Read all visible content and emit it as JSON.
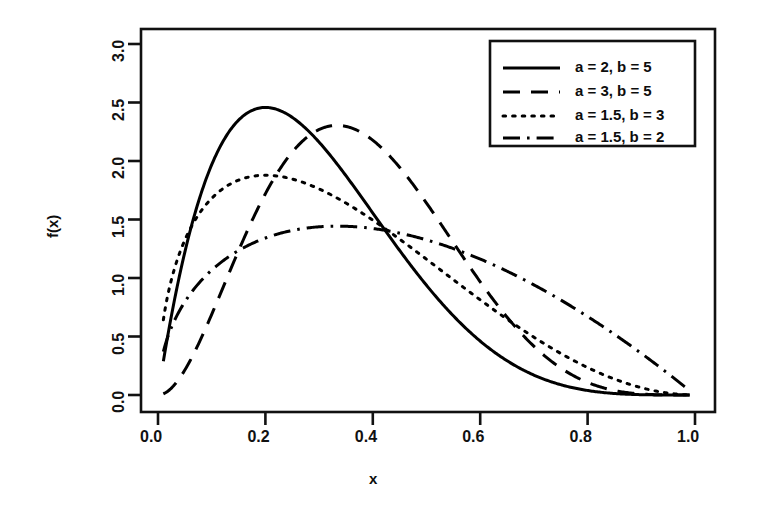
{
  "chart_data": {
    "type": "line",
    "title": "",
    "subtitle": "",
    "xlabel": "x",
    "ylabel": "f(x)",
    "xlim": [
      0.0,
      1.0
    ],
    "ylim": [
      0.0,
      3.0
    ],
    "xticks": [
      "0.0",
      "0.2",
      "0.4",
      "0.6",
      "0.8",
      "1.0"
    ],
    "xtick_values": [
      0.0,
      0.2,
      0.4,
      0.6,
      0.8,
      1.0
    ],
    "yticks": [
      "0.0",
      "0.5",
      "1.0",
      "1.5",
      "2.0",
      "2.5",
      "3.0"
    ],
    "ytick_values": [
      0.0,
      0.5,
      1.0,
      1.5,
      2.0,
      2.5,
      3.0
    ],
    "grid": false,
    "legend_position": "top-right",
    "distribution": "beta",
    "x": [
      0.01,
      0.02,
      0.04,
      0.06,
      0.08,
      0.1,
      0.12,
      0.14,
      0.16,
      0.18,
      0.2,
      0.22,
      0.24,
      0.26,
      0.28,
      0.3,
      0.32,
      0.34,
      0.36,
      0.38,
      0.4,
      0.44,
      0.48,
      0.52,
      0.56,
      0.6,
      0.64,
      0.68,
      0.72,
      0.76,
      0.8,
      0.84,
      0.88,
      0.92,
      0.96,
      0.99
    ],
    "series": [
      {
        "name": "a = 2, b = 5",
        "a": 2,
        "b": 5,
        "linestyle": "solid",
        "color": "#000000",
        "peak_x": 0.2,
        "peak_y": 2.46,
        "values": [
          0.29,
          0.55,
          1.02,
          1.41,
          1.75,
          2.01,
          2.21,
          2.35,
          2.44,
          2.47,
          2.46,
          2.41,
          2.33,
          2.23,
          2.11,
          1.98,
          1.84,
          1.69,
          1.54,
          1.4,
          1.25,
          0.99,
          0.75,
          0.55,
          0.39,
          0.26,
          0.16,
          0.09,
          0.05,
          0.02,
          0.01,
          0.0,
          0.0,
          0.0,
          0.0,
          0.0
        ]
      },
      {
        "name": "a = 3, b = 5",
        "a": 3,
        "b": 5,
        "linestyle": "dashed",
        "color": "#000000",
        "peak_x": 0.333,
        "peak_y": 2.3,
        "values": [
          0.01,
          0.04,
          0.14,
          0.3,
          0.5,
          0.72,
          0.95,
          1.18,
          1.4,
          1.6,
          1.77,
          1.92,
          2.04,
          2.14,
          2.21,
          2.25,
          2.27,
          2.27,
          2.25,
          2.21,
          2.15,
          1.99,
          1.78,
          1.54,
          1.29,
          1.03,
          0.79,
          0.57,
          0.38,
          0.23,
          0.12,
          0.05,
          0.02,
          0.0,
          0.0,
          0.0
        ]
      },
      {
        "name": "a = 1.5, b = 3",
        "a": 1.5,
        "b": 3,
        "linestyle": "dotted",
        "color": "#000000",
        "peak_x": 0.2,
        "peak_y": 1.88,
        "values": [
          0.63,
          0.88,
          1.2,
          1.42,
          1.58,
          1.69,
          1.77,
          1.83,
          1.86,
          1.88,
          1.88,
          1.87,
          1.85,
          1.82,
          1.78,
          1.73,
          1.68,
          1.62,
          1.56,
          1.5,
          1.43,
          1.29,
          1.14,
          0.99,
          0.84,
          0.7,
          0.56,
          0.43,
          0.32,
          0.22,
          0.14,
          0.08,
          0.03,
          0.01,
          0.0,
          0.0
        ]
      },
      {
        "name": "a = 1.5, b = 2",
        "a": 1.5,
        "b": 2,
        "linestyle": "dashdot",
        "color": "#000000",
        "peak_x": 0.333,
        "peak_y": 1.45,
        "values": [
          0.19,
          0.27,
          0.38,
          0.46,
          0.53,
          0.6,
          0.66,
          0.71,
          0.76,
          0.81,
          0.85,
          0.89,
          0.93,
          0.96,
          0.99,
          1.02,
          1.05,
          1.07,
          1.09,
          1.11,
          1.13,
          1.15,
          1.16,
          1.17,
          1.16,
          1.14,
          1.11,
          1.07,
          1.01,
          0.94,
          0.85,
          0.74,
          0.62,
          0.47,
          0.3,
          0.13
        ]
      }
    ]
  },
  "axes": {
    "xlabel": "x",
    "ylabel": "f(x)"
  },
  "legend": {
    "entries": [
      {
        "label": "a = 2, b = 5",
        "linestyle": "solid"
      },
      {
        "label": "a = 3, b = 5",
        "linestyle": "dashed"
      },
      {
        "label": "a = 1.5, b = 3",
        "linestyle": "dotted"
      },
      {
        "label": "a = 1.5, b = 2",
        "linestyle": "dashdot"
      }
    ]
  },
  "style": {
    "line_color": "#000000",
    "axis_color": "#111111",
    "background": "#ffffff"
  }
}
